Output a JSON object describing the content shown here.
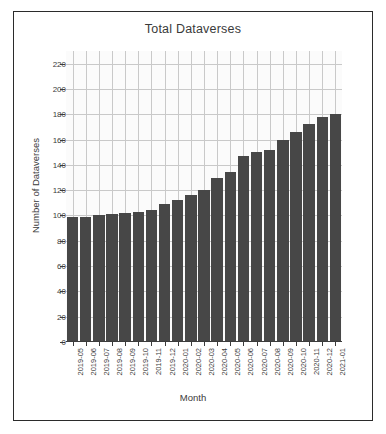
{
  "chart_data": {
    "type": "bar",
    "title": "Total Dataverses",
    "xlabel": "Month",
    "ylabel": "Number of Dataverses",
    "categories": [
      "2019-05",
      "2019-06",
      "2019-07",
      "2019-08",
      "2019-09",
      "2019-10",
      "2019-11",
      "2019-12",
      "2020-01",
      "2020-02",
      "2020-03",
      "2020-04",
      "2020-05",
      "2020-06",
      "2020-07",
      "2020-08",
      "2020-09",
      "2020-10",
      "2020-11",
      "2020-12",
      "2021-01"
    ],
    "values": [
      99,
      99,
      100,
      101,
      102,
      103,
      104,
      109,
      112,
      116,
      120,
      130,
      134,
      147,
      150,
      152,
      160,
      166,
      172,
      178,
      180
    ],
    "ylim": [
      0,
      230
    ],
    "ytick_labels": [
      "0",
      "20",
      "40",
      "60",
      "80",
      "100",
      "120",
      "140",
      "160",
      "180",
      "200",
      "220"
    ],
    "ytick_values": [
      0,
      20,
      40,
      60,
      80,
      100,
      120,
      140,
      160,
      180,
      200,
      220
    ],
    "grid": "both",
    "legend": "none",
    "bar_color": "#474747",
    "plot_background": "#fbfbfb",
    "grid_color": "#c9c9c9",
    "axis_color": "#3c3c3c"
  }
}
